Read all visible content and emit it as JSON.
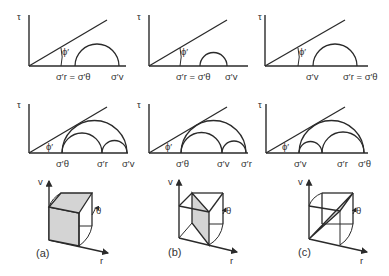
{
  "figure": {
    "mohr_panels": [
      {
        "row": 1,
        "col": 1,
        "y_axis_label": "τ",
        "angle_label": "ϕ′",
        "labels": [
          {
            "text": "σ′r = σ′θ"
          },
          {
            "text": "σ′v"
          }
        ]
      },
      {
        "row": 1,
        "col": 2,
        "y_axis_label": "τ",
        "angle_label": "ϕ′",
        "labels": [
          {
            "text": "σ′r = σ′θ"
          },
          {
            "text": "σ′v"
          }
        ]
      },
      {
        "row": 1,
        "col": 3,
        "y_axis_label": "τ",
        "angle_label": "ϕ′",
        "labels": [
          {
            "text": "σ′v"
          },
          {
            "text": "σ′r = σ′θ"
          }
        ]
      },
      {
        "row": 2,
        "col": 1,
        "y_axis_label": "τ",
        "angle_label": "ϕ′",
        "labels": [
          {
            "text": "σ′θ"
          },
          {
            "text": "σ′r"
          },
          {
            "text": "σ′v"
          }
        ]
      },
      {
        "row": 2,
        "col": 2,
        "y_axis_label": "τ",
        "angle_label": "ϕ′",
        "labels": [
          {
            "text": "σ′θ"
          },
          {
            "text": "σ′v"
          },
          {
            "text": "σ′r"
          }
        ]
      },
      {
        "row": 2,
        "col": 3,
        "y_axis_label": "τ",
        "angle_label": "ϕ′",
        "labels": [
          {
            "text": "σ′v"
          },
          {
            "text": "σ′r"
          },
          {
            "text": "σ′θ"
          }
        ]
      }
    ],
    "element_panels": [
      {
        "caption": "(a)",
        "axis_v": "v",
        "axis_r": "r",
        "axis_theta": "θ"
      },
      {
        "caption": "(b)",
        "axis_v": "v",
        "axis_r": "r",
        "axis_theta": "θ"
      },
      {
        "caption": "(c)",
        "axis_v": "v",
        "axis_r": "r",
        "axis_theta": "θ"
      }
    ]
  }
}
